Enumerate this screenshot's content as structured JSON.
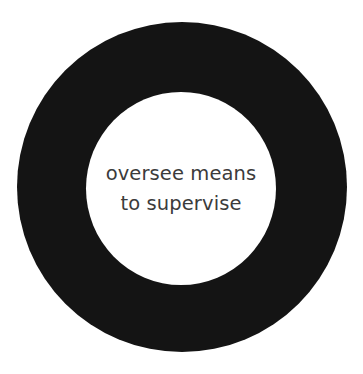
{
  "canvas": {
    "width": 363,
    "height": 374,
    "background_color": "#ffffff"
  },
  "figure": {
    "shape_name": "annulus-ring",
    "ring_color": "#141414",
    "inner_fill_color": "#ffffff",
    "outer_diameter_px": 330,
    "inner_diameter_px": 191,
    "ring_thickness_px": 69,
    "center_x_px": 182,
    "center_y_px": 187
  },
  "caption": {
    "text_color": "#3b3b3b",
    "lines": [
      "oversee means",
      "to supervise"
    ],
    "full_text": "oversee means to supervise"
  }
}
